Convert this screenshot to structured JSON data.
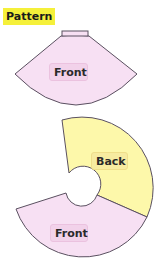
{
  "title": "Pattern",
  "colors": {
    "title_highlight": "#f5f03a",
    "front_fill": "#f7e0f3",
    "back_fill": "#fdf8aa",
    "outline": "#5a5060",
    "front_label_bg": "#f2d2ea",
    "back_label_bg": "#f7eba0"
  },
  "pieces": [
    {
      "id": "top-front",
      "label": "Front",
      "shape": "skirt-sector-with-waistband",
      "color": "pink"
    },
    {
      "id": "circle-back",
      "label": "Back",
      "shape": "annulus-sector",
      "color": "yellow"
    },
    {
      "id": "circle-front",
      "label": "Front",
      "shape": "annulus-sector",
      "color": "pink"
    }
  ]
}
